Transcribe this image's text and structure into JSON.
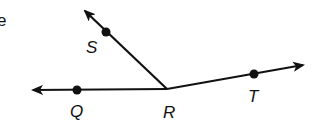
{
  "diagram": {
    "type": "geometry-angles",
    "colors": {
      "stroke": "#111111",
      "background": "#ffffff"
    },
    "fragment_text": "e",
    "vertex": {
      "name": "R",
      "label": "R",
      "x": 167,
      "y": 89,
      "label_x": 163,
      "label_y": 118
    },
    "rays": [
      {
        "name": "ray-RQ",
        "through_point": {
          "label": "Q",
          "x": 77,
          "y": 90,
          "label_x": 70,
          "label_y": 117
        },
        "arrow_tip": {
          "x": 33,
          "y": 90
        }
      },
      {
        "name": "ray-RS",
        "through_point": {
          "label": "S",
          "x": 106,
          "y": 32,
          "label_x": 86,
          "label_y": 53
        },
        "arrow_tip": {
          "x": 85,
          "y": 11
        }
      },
      {
        "name": "ray-RT",
        "through_point": {
          "label": "T",
          "x": 254,
          "y": 74,
          "label_x": 248,
          "label_y": 102
        },
        "arrow_tip": {
          "x": 303,
          "y": 65
        }
      }
    ],
    "labels": {
      "Q": "Q",
      "R": "R",
      "S": "S",
      "T": "T"
    }
  }
}
